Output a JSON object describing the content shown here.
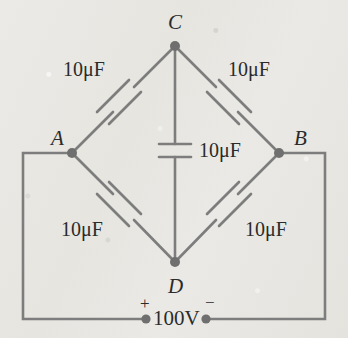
{
  "diagram": {
    "colors": {
      "wire": "#7d7d7d",
      "node": "#6f6f6f",
      "text": "#2b2b2b",
      "background": "#e9e8e4"
    },
    "nodes": [
      {
        "id": "node-a",
        "label": "A",
        "x": 72,
        "y": 153
      },
      {
        "id": "node-b",
        "label": "B",
        "x": 279,
        "y": 153
      },
      {
        "id": "node-c",
        "label": "C",
        "x": 175,
        "y": 46
      },
      {
        "id": "node-d",
        "label": "D",
        "x": 175,
        "y": 262
      }
    ],
    "capacitors": [
      {
        "id": "capacitor-ac",
        "label": "10μF",
        "branch": "A-C",
        "orientation": "diagonal"
      },
      {
        "id": "capacitor-cb",
        "label": "10μF",
        "branch": "C-B",
        "orientation": "diagonal"
      },
      {
        "id": "capacitor-cd",
        "label": "10μF",
        "branch": "C-D",
        "orientation": "vertical"
      },
      {
        "id": "capacitor-ad",
        "label": "10μF",
        "branch": "A-D",
        "orientation": "diagonal"
      },
      {
        "id": "capacitor-db",
        "label": "10μF",
        "branch": "D-B",
        "orientation": "diagonal"
      }
    ],
    "source": {
      "id": "voltage-source",
      "label": "100V",
      "positive_terminal": "+",
      "negative_terminal": "−"
    }
  }
}
